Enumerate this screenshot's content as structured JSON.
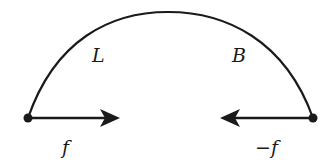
{
  "diagram": {
    "arc": {
      "left_label": "L",
      "right_label": "B"
    },
    "left_endpoint": {
      "arrow_label": "f"
    },
    "right_endpoint": {
      "arrow_label": "−f"
    },
    "colors": {
      "stroke": "#1a1a1a",
      "background": "#ffffff"
    }
  }
}
